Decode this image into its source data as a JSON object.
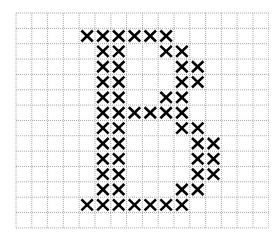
{
  "diagram": {
    "type": "cross-stitch-pattern",
    "letter": "B",
    "grid": {
      "columns": 16,
      "rows": 14,
      "cell_width": 15.8,
      "cell_height": 15.35,
      "line_color": "#a8a8a8",
      "line_style": "dotted",
      "background": "#ffffff"
    },
    "stitch": {
      "symbol": "X",
      "color": "#000000",
      "stroke_width": 2.6
    },
    "rows": [
      [],
      [
        4,
        5,
        6,
        7,
        8,
        9
      ],
      [
        5,
        6,
        9,
        10
      ],
      [
        5,
        6,
        10,
        11
      ],
      [
        5,
        6,
        10,
        11
      ],
      [
        5,
        6,
        9,
        10
      ],
      [
        5,
        6,
        7,
        8,
        9,
        10
      ],
      [
        5,
        6,
        10,
        11
      ],
      [
        5,
        6,
        11,
        12
      ],
      [
        5,
        6,
        11,
        12
      ],
      [
        5,
        6,
        11,
        12
      ],
      [
        5,
        6,
        10,
        11
      ],
      [
        4,
        5,
        6,
        7,
        8,
        9,
        10
      ],
      []
    ]
  }
}
